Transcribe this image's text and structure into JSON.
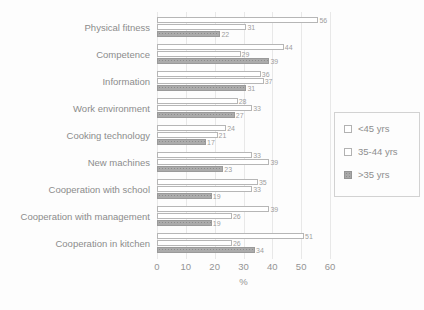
{
  "chart_data": {
    "type": "bar",
    "orientation": "horizontal",
    "title": "",
    "xlabel": "%",
    "ylabel": "",
    "xlim": [
      0,
      60
    ],
    "xticks": [
      0,
      10,
      20,
      30,
      40,
      50,
      60
    ],
    "grid": true,
    "legend_position": "right",
    "categories": [
      "Physical fitness",
      "Competence",
      "Information",
      "Work environment",
      "Cooking technology",
      "New machines",
      "Cooperation with school",
      "Cooperation with management",
      "Cooperation in kitchen"
    ],
    "series": [
      {
        "name": "<45 yrs",
        "fill": "#ffffff",
        "values": [
          56,
          44,
          36,
          28,
          24,
          33,
          35,
          39,
          51
        ]
      },
      {
        "name": "35-44 yrs",
        "fill": "#ffffff",
        "values": [
          31,
          29,
          37,
          33,
          21,
          39,
          33,
          26,
          26
        ]
      },
      {
        "name": ">35 yrs",
        "fill": "#ababab",
        "values": [
          22,
          39,
          31,
          27,
          17,
          23,
          19,
          19,
          34
        ]
      }
    ]
  },
  "colors": {
    "text": "#8e8e8e",
    "bar_border": "#b6b6b6",
    "gray_fill": "#ababab",
    "grid": "#e8e8e8",
    "legend_border": "#d2d2d2",
    "background": "#fdfdfd"
  }
}
